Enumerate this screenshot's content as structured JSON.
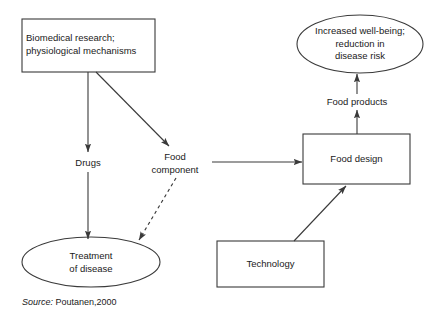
{
  "diagram": {
    "title_source": {
      "prefix": "Source:",
      "citation": "Poutanen,2000"
    },
    "stroke_color": "#3a3a3a",
    "text_color": "#1a1a1a",
    "background": "#ffffff",
    "nodes": [
      {
        "id": "biomedical-research",
        "shape": "rect",
        "label": "Biomedical research;\nphysiological mechanisms",
        "x": 22,
        "y": 19,
        "w": 133,
        "h": 53
      },
      {
        "id": "increased-wellbeing",
        "shape": "ellipse",
        "label": "Increased well-being;\nreduction in\ndisease risk",
        "cx": 360,
        "cy": 44,
        "rx": 63,
        "ry": 29
      },
      {
        "id": "food-design",
        "shape": "rect",
        "label": "Food design",
        "x": 303,
        "y": 134,
        "w": 107,
        "h": 50
      },
      {
        "id": "treatment-of-disease",
        "shape": "ellipse",
        "label": "Treatment\nof disease",
        "cx": 91,
        "cy": 262,
        "rx": 69,
        "ry": 25
      },
      {
        "id": "technology",
        "shape": "rect",
        "label": "Technology",
        "x": 217,
        "y": 241,
        "w": 107,
        "h": 46
      }
    ],
    "edge_labels": [
      {
        "id": "drugs",
        "label": "Drugs",
        "cx": 88,
        "cy": 163
      },
      {
        "id": "food-component",
        "label": "Food\ncomponent",
        "cx": 175,
        "cy": 164
      },
      {
        "id": "food-products",
        "label": "Food products",
        "cx": 357,
        "cy": 102
      }
    ],
    "edges": [
      {
        "id": "biomedical-to-drugs",
        "style": "solid",
        "arrow": "end"
      },
      {
        "id": "biomedical-to-food-component",
        "style": "solid",
        "arrow": "end"
      },
      {
        "id": "drugs-to-treatment",
        "style": "solid",
        "arrow": "end"
      },
      {
        "id": "food-component-to-treatment",
        "style": "dashed",
        "arrow": "end"
      },
      {
        "id": "food-component-to-food-design",
        "style": "solid",
        "arrow": "end"
      },
      {
        "id": "technology-to-food-design",
        "style": "solid",
        "arrow": "end"
      },
      {
        "id": "food-design-to-wellbeing",
        "style": "solid",
        "arrow": "end"
      }
    ]
  }
}
